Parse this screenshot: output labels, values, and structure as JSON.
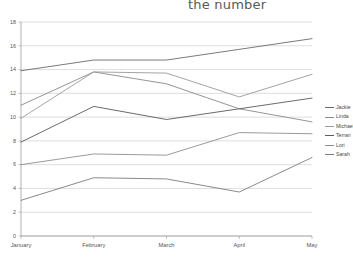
{
  "title": {
    "text": "the number"
  },
  "legend": {
    "position": "right",
    "entries": [
      {
        "label": "Jackie",
        "color": "#6b6b6b"
      },
      {
        "label": "Linda",
        "color": "#8a8a8a"
      },
      {
        "label": "Michael",
        "color": "#9a9a9a"
      },
      {
        "label": "Terran",
        "color": "#5a5a5a"
      },
      {
        "label": "Lori",
        "color": "#8f8f8f"
      },
      {
        "label": "Sarah",
        "color": "#7d7d7d"
      }
    ]
  },
  "axes": {
    "y_ticks": [
      "0",
      "2",
      "4",
      "6",
      "8",
      "10",
      "12",
      "14",
      "16",
      "18"
    ],
    "x_ticks": [
      "January",
      "February",
      "March",
      "April",
      "May"
    ],
    "ylim_min": 0,
    "ylim_max": 18,
    "grid": "horizontal"
  },
  "chart_data": {
    "type": "line",
    "title": "the number",
    "xlabel": "",
    "ylabel": "",
    "ylim": [
      0,
      18
    ],
    "grid": true,
    "legend_position": "right",
    "categories": [
      "January",
      "February",
      "March",
      "April",
      "May"
    ],
    "series": [
      {
        "name": "Jackie",
        "color": "#6b6b6b",
        "values": [
          13.9,
          14.8,
          14.8,
          15.7,
          16.6
        ]
      },
      {
        "name": "Linda",
        "color": "#8a8a8a",
        "values": [
          11.0,
          13.8,
          12.8,
          10.7,
          9.6
        ]
      },
      {
        "name": "Michael",
        "color": "#9a9a9a",
        "values": [
          9.9,
          13.8,
          13.7,
          11.7,
          13.6
        ]
      },
      {
        "name": "Terran",
        "color": "#5a5a5a",
        "values": [
          7.9,
          10.9,
          9.8,
          10.7,
          11.6
        ]
      },
      {
        "name": "Lori",
        "color": "#8f8f8f",
        "values": [
          6.0,
          6.9,
          6.8,
          8.7,
          8.6
        ]
      },
      {
        "name": "Sarah",
        "color": "#7d7d7d",
        "values": [
          3.0,
          4.9,
          4.8,
          3.7,
          6.6
        ]
      }
    ]
  }
}
